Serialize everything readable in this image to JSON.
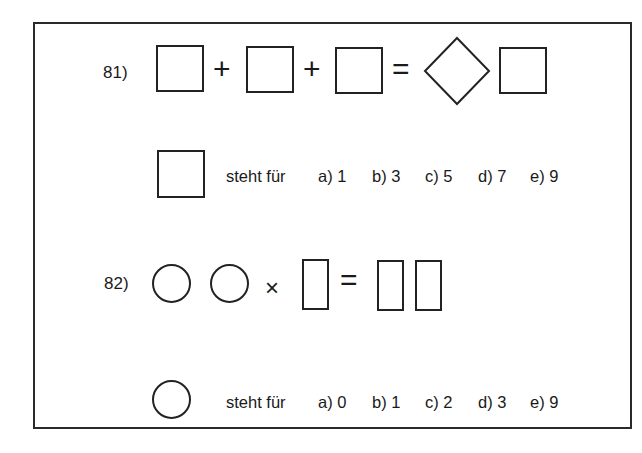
{
  "q81": {
    "number": "81)",
    "equation": {
      "terms": [
        "square",
        "square",
        "square"
      ],
      "operators": [
        "+",
        "+",
        "="
      ],
      "result": [
        "diamond",
        "square"
      ]
    },
    "prompt": "steht für",
    "options": [
      {
        "label": "a) 1"
      },
      {
        "label": "b) 3"
      },
      {
        "label": "c) 5"
      },
      {
        "label": "d) 7"
      },
      {
        "label": "e) 9"
      }
    ]
  },
  "q82": {
    "number": "82)",
    "equation": {
      "terms": [
        "circle",
        "circle",
        "rectangle"
      ],
      "operators": [
        "×",
        "="
      ],
      "result": [
        "rectangle",
        "rectangle"
      ]
    },
    "prompt": "steht für",
    "options": [
      {
        "label": "a) 0"
      },
      {
        "label": "b) 1"
      },
      {
        "label": "c) 2"
      },
      {
        "label": "d) 3"
      },
      {
        "label": "e) 9"
      }
    ]
  }
}
